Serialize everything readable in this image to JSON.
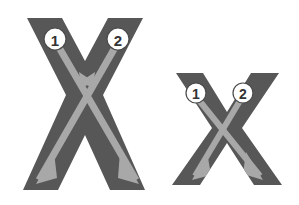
{
  "figure": {
    "background_color": "#ffffff",
    "glyph_color": "#575757",
    "arrow_color": "#a8a8a8",
    "marker_fill": "#ffffff",
    "marker_stroke": "#4a4a4a",
    "marker_text_color": "#333333",
    "width": 299,
    "height": 205
  },
  "glyphs": [
    {
      "id": "uppercase-x",
      "letter": "X",
      "case": "uppercase",
      "size": "large",
      "bounds": {
        "x": 20,
        "y": 18,
        "width": 130,
        "height": 172
      },
      "strokes": [
        {
          "number": "1",
          "name": "stroke-1",
          "direction": "top-left to bottom-right",
          "start": {
            "x": 57,
            "y": 44
          },
          "end": {
            "x": 134,
            "y": 176
          },
          "marker": {
            "x": 55,
            "y": 39,
            "r": 11
          },
          "arrowheads": [
            "mid",
            "end"
          ]
        },
        {
          "number": "2",
          "name": "stroke-2",
          "direction": "top-right to bottom-left",
          "start": {
            "x": 117,
            "y": 44
          },
          "end": {
            "x": 41,
            "y": 176
          },
          "marker": {
            "x": 118,
            "y": 39,
            "r": 11
          },
          "arrowheads": [
            "mid",
            "end"
          ]
        }
      ]
    },
    {
      "id": "lowercase-x",
      "letter": "x",
      "case": "lowercase",
      "size": "small",
      "bounds": {
        "x": 172,
        "y": 73,
        "width": 110,
        "height": 112
      },
      "strokes": [
        {
          "number": "1",
          "name": "stroke-1",
          "direction": "top-left to bottom-right",
          "start": {
            "x": 198,
            "y": 99
          },
          "end": {
            "x": 258,
            "y": 172
          },
          "marker": {
            "x": 196,
            "y": 93,
            "r": 10
          },
          "arrowheads": [
            "end"
          ]
        },
        {
          "number": "2",
          "name": "stroke-2",
          "direction": "top-right to bottom-left",
          "start": {
            "x": 241,
            "y": 99
          },
          "end": {
            "x": 197,
            "y": 172
          },
          "marker": {
            "x": 243,
            "y": 93,
            "r": 10
          },
          "arrowheads": [
            "end"
          ]
        }
      ]
    }
  ],
  "markers": {
    "one": "1",
    "two": "2"
  }
}
